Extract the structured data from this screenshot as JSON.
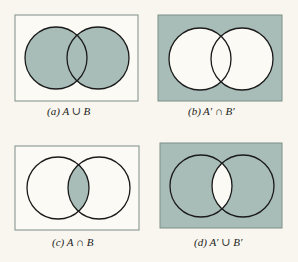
{
  "colors": {
    "background": "#f8f6ee",
    "shade": "#a9bdb8",
    "white": "#fbfaf5",
    "stroke": "#1a1a1a",
    "frame": "#7f8e8a"
  },
  "panels": [
    {
      "id": "a",
      "caption": "(a) A ∪ B",
      "region": "A union B",
      "box": {
        "x": 15,
        "y": 15,
        "w": 123,
        "h": 86
      },
      "circles": {
        "left": {
          "cx": 56,
          "cy": 58
        },
        "right": {
          "cx": 98,
          "cy": 58
        },
        "r": 31
      },
      "shading": "union"
    },
    {
      "id": "b",
      "caption": "(b) A′ ∩ B′",
      "region": "complement of A intersect complement of B",
      "box": {
        "x": 158,
        "y": 15,
        "w": 124,
        "h": 86
      },
      "circles": {
        "left": {
          "cx": 200,
          "cy": 59
        },
        "right": {
          "cx": 242,
          "cy": 59
        },
        "r": 31
      },
      "shading": "outside-both"
    },
    {
      "id": "c",
      "caption": "(c) A ∩ B",
      "region": "A intersect B",
      "box": {
        "x": 15,
        "y": 146,
        "w": 124,
        "h": 84
      },
      "circles": {
        "left": {
          "cx": 58,
          "cy": 188
        },
        "right": {
          "cx": 99,
          "cy": 188
        },
        "r": 31
      },
      "shading": "intersection"
    },
    {
      "id": "d",
      "caption": "(d) A′ ∪ B′",
      "region": "complement of A union complement of B",
      "box": {
        "x": 160,
        "y": 143,
        "w": 122,
        "h": 85
      },
      "circles": {
        "left": {
          "cx": 201,
          "cy": 186
        },
        "right": {
          "cx": 243,
          "cy": 186
        },
        "r": 31
      },
      "shading": "not-intersection"
    }
  ],
  "captions_pos": {
    "a": {
      "x": 47,
      "y": 107
    },
    "b": {
      "x": 191,
      "y": 107
    },
    "c": {
      "x": 52,
      "y": 237
    },
    "d": {
      "x": 194,
      "y": 237
    }
  }
}
